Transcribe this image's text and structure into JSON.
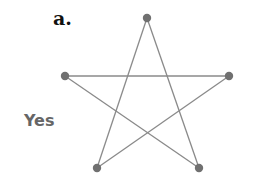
{
  "panel": {
    "label": "a."
  },
  "answer": {
    "label": "Yes"
  },
  "graph": {
    "type": "pentagram",
    "node_color": "#707070",
    "edge_color": "#8a8a8a",
    "nodes": [
      {
        "id": "top",
        "x": 147,
        "y": 18
      },
      {
        "id": "left",
        "x": 65,
        "y": 76
      },
      {
        "id": "right",
        "x": 229,
        "y": 76
      },
      {
        "id": "bottom-left",
        "x": 97,
        "y": 168
      },
      {
        "id": "bottom-right",
        "x": 199,
        "y": 168
      }
    ],
    "edges": [
      [
        "top",
        "bottom-left"
      ],
      [
        "top",
        "bottom-right"
      ],
      [
        "left",
        "right"
      ],
      [
        "left",
        "bottom-right"
      ],
      [
        "right",
        "bottom-left"
      ]
    ]
  }
}
